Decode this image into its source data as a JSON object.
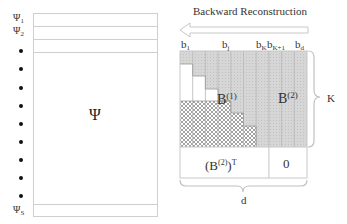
{
  "left_matrix": {
    "symbol": "Ψ",
    "row_labels": [
      {
        "base": "Ψ",
        "sub": "1"
      },
      {
        "base": "Ψ",
        "sub": "2"
      },
      {
        "base": "Ψ",
        "sub": "S"
      }
    ],
    "ellipsis_dots": 11
  },
  "right_diagram": {
    "arrow_label": "Backward Reconstruction",
    "column_labels": [
      {
        "base": "b",
        "sub": "1"
      },
      {
        "base": "b",
        "sub": "j"
      },
      {
        "base": "b",
        "sub": "K"
      },
      {
        "base": "b",
        "sub": "K+1"
      },
      {
        "base": "b",
        "sub": "d"
      }
    ],
    "block_b1": {
      "base": "B",
      "sup": "(1)"
    },
    "block_b2": {
      "base": "B",
      "sup": "(2)"
    },
    "bottom_left": {
      "base": "(B",
      "sup": "(2)",
      "rest": ")",
      "sup2": "T"
    },
    "bottom_right": "0",
    "brace_right_label": "K",
    "brace_bottom_label": "d"
  },
  "colors": {
    "gray_fill": "#d4d4d4",
    "line": "#bdbdbd",
    "hatch": "#8a8a8a"
  }
}
